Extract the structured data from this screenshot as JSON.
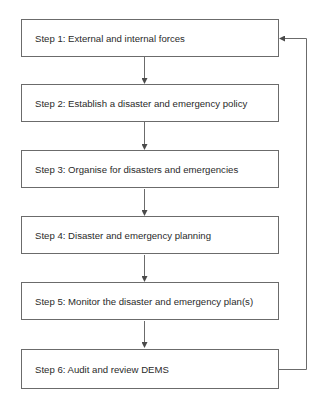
{
  "diagram": {
    "type": "flowchart",
    "steps": [
      {
        "label": "Step 1: External and internal forces"
      },
      {
        "label": "Step 2: Establish a disaster and emergency policy"
      },
      {
        "label": "Step 3: Organise for disasters and emergencies"
      },
      {
        "label": "Step 4: Disaster and emergency planning"
      },
      {
        "label": "Step 5: Monitor the disaster and emergency plan(s)"
      },
      {
        "label": "Step 6: Audit and review DEMS"
      }
    ],
    "edges": [
      {
        "from": 1,
        "to": 2
      },
      {
        "from": 2,
        "to": 3
      },
      {
        "from": 3,
        "to": 4
      },
      {
        "from": 4,
        "to": 5
      },
      {
        "from": 5,
        "to": 6
      },
      {
        "from": 6,
        "to": 1,
        "kind": "feedback-loop"
      }
    ],
    "colors": {
      "line": "#6b6b6b",
      "text": "#2a2a2a",
      "background": "#ffffff"
    }
  }
}
